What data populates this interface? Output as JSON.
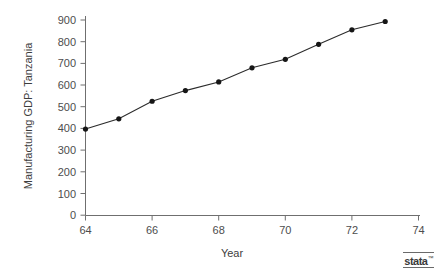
{
  "chart_data": {
    "type": "line",
    "title": "",
    "xlabel": "Year",
    "ylabel": "Manufacturing GDP: Tanzania",
    "x": [
      64,
      65,
      66,
      67,
      68,
      69,
      70,
      71,
      72,
      73
    ],
    "values": [
      398,
      445,
      526,
      575,
      615,
      680,
      719,
      788,
      855,
      893
    ],
    "series": [
      {
        "name": "Manufacturing GDP: Tanzania",
        "values": [
          398,
          445,
          526,
          575,
          615,
          680,
          719,
          788,
          855,
          893
        ]
      }
    ],
    "xlim": [
      63.5,
      74
    ],
    "ylim": [
      0,
      930
    ],
    "xticks": [
      64,
      66,
      68,
      70,
      72,
      74
    ],
    "xtick_labels": [
      "64",
      "66",
      "68",
      "70",
      "72",
      "74"
    ],
    "yticks": [
      0,
      100,
      200,
      300,
      400,
      500,
      600,
      700,
      800,
      900
    ],
    "ytick_labels": [
      "0",
      "100",
      "200",
      "300",
      "400",
      "500",
      "600",
      "700",
      "800",
      "900"
    ],
    "grid": false,
    "legend": "none",
    "marker": "filled-circle",
    "line_color": "#2b2b2b",
    "marker_color": "#161616",
    "axis_color": "#6f6f6f"
  },
  "branding": {
    "logo_text": "stata",
    "logo_mark": "™"
  }
}
